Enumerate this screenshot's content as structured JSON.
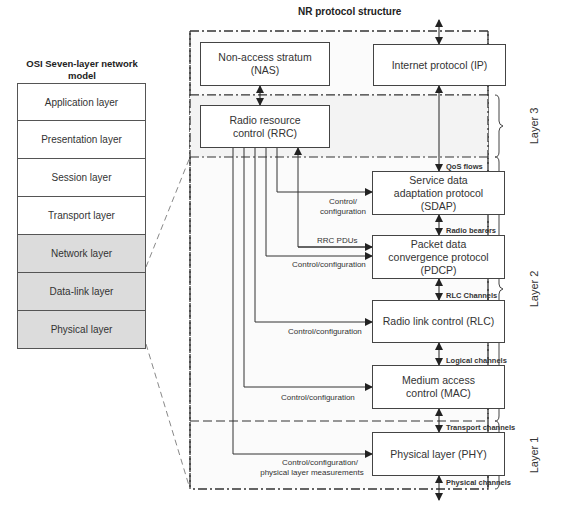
{
  "diagram": {
    "title": "NR protocol structure",
    "osi": {
      "title": "OSI Seven-layer network model",
      "layers": [
        {
          "label": "Application layer",
          "shaded": false
        },
        {
          "label": "Presentation layer",
          "shaded": false
        },
        {
          "label": "Session layer",
          "shaded": false
        },
        {
          "label": "Transport layer",
          "shaded": false
        },
        {
          "label": "Network layer",
          "shaded": true
        },
        {
          "label": "Data-link layer",
          "shaded": true
        },
        {
          "label": "Physical layer",
          "shaded": true
        }
      ]
    },
    "boxes": {
      "nas": "Non-access stratum (NAS)",
      "ip": "Internet protocol (IP)",
      "rrc": "Radio resource control (RRC)",
      "sdap": "Service data adaptation protocol (SDAP)",
      "pdcp": "Packet data convergence protocol (PDCP)",
      "rlc": "Radio link control (RLC)",
      "mac": "Medium access control (MAC)",
      "phy": "Physical layer (PHY)"
    },
    "channels": {
      "qos": "QoS flows",
      "radio_bearers": "Radio bearers",
      "rlc_channels": "RLC Channels",
      "logical": "Logical channels",
      "transport": "Transport channels",
      "physical": "Physical channels"
    },
    "connections": {
      "sdap_ctrl": "Control/ configuration",
      "rrc_pdus": "RRC PDUs",
      "pdcp_ctrl": "Control/configuration",
      "rlc_ctrl": "Control/configuration",
      "mac_ctrl": "Control/configuration",
      "phy_ctrl_1": "Control/configuration/",
      "phy_ctrl_2": "physical layer measurements"
    },
    "layer_labels": {
      "layer3": "Layer 3",
      "layer2": "Layer 2",
      "layer1": "Layer 1"
    }
  }
}
